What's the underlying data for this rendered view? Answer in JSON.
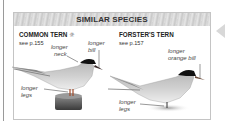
{
  "header": {
    "title": "SIMILAR SPECIES"
  },
  "species": [
    {
      "name": "COMMON TERN",
      "icon": "sun-icon",
      "icon_glyph": "☼",
      "reference": "see p.155",
      "annotations": [
        {
          "line1": "longer",
          "line2": "neck"
        },
        {
          "line1": "longer",
          "line2": "bill"
        },
        {
          "line1": "longer",
          "line2": "legs"
        }
      ]
    },
    {
      "name": "FORSTER'S TERN",
      "reference": "see p.157",
      "annotations": [
        {
          "line1": "longer",
          "line2": "orange bill"
        },
        {
          "line1": "longer",
          "line2": "legs"
        }
      ]
    }
  ],
  "colors": {
    "border": "#c4c4c4",
    "header_bg": "#d6d6d6",
    "text": "#333333",
    "cap": "#111111"
  }
}
